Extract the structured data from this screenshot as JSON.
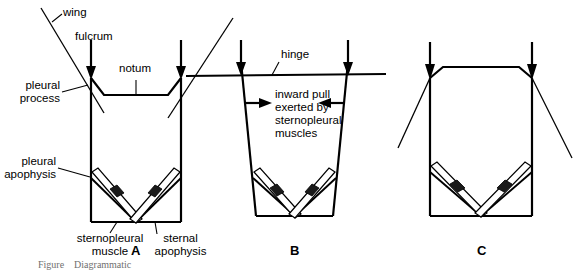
{
  "figure": {
    "panels": [
      {
        "id": "A",
        "letter": "A",
        "state": "resting / wings up"
      },
      {
        "id": "B",
        "letter": "B",
        "state": "sternopleural muscles pulling inward"
      },
      {
        "id": "C",
        "letter": "C",
        "state": "notum arched, wings down"
      }
    ],
    "caption": "Figure    Diagrammatic",
    "colors": {
      "ink": "#000000",
      "background": "#ffffff",
      "apodeme": "#1a1a1a",
      "caption": "#6f6f6f"
    }
  },
  "labels": {
    "wing": "wing",
    "fulcrum": "fulcrum",
    "notum": "notum",
    "pleural_process_line1": "pleural",
    "pleural_process_line2": "process",
    "pleural_apophysis_line1": "pleural",
    "pleural_apophysis_line2": "apophysis",
    "sternopleural_muscle_line1": "sternopleural",
    "sternopleural_muscle_line2": "muscle",
    "sternal_apophysis_line1": "sternal",
    "sternal_apophysis_line2": "apophysis",
    "hinge": "hinge",
    "inward_pull_line1": "inward pull",
    "inward_pull_line2": "exerted by",
    "inward_pull_line3": "sternopleural",
    "inward_pull_line4": "muscles"
  },
  "panel_letters": {
    "a": "A",
    "b": "B",
    "c": "C"
  }
}
